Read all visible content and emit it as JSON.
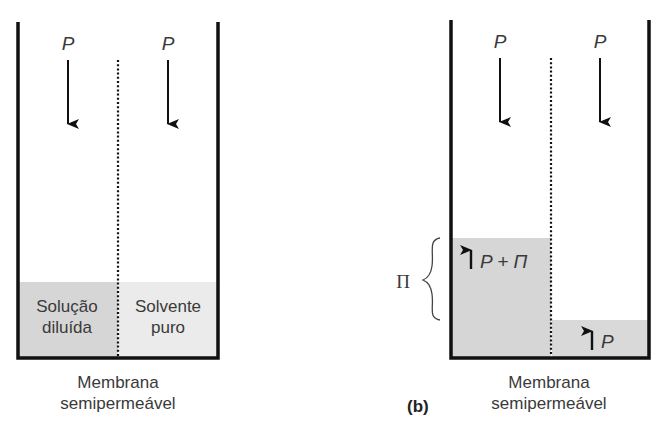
{
  "figure": {
    "panel_a": {
      "pressure_labels": [
        "P",
        "P"
      ],
      "left_compartment_label": [
        "Solução",
        "diluída"
      ],
      "right_compartment_label": [
        "Solvente",
        "puro"
      ],
      "membrane_caption": [
        "Membrana",
        "semipermeável"
      ]
    },
    "panel_b": {
      "panel_label": "(b)",
      "pressure_labels": [
        "P",
        "P"
      ],
      "left_fluid_label": "P + Π",
      "right_fluid_label": "P",
      "osmotic_pressure_label": "Π",
      "membrane_caption": [
        "Membrana",
        "semipermeável"
      ]
    },
    "colors": {
      "wall": "#111111",
      "fluid_solution": "#d6d6d6",
      "fluid_solvent": "#ebebeb",
      "fluid_right_b": "#d9d9d9",
      "text": "#3a3a3a"
    }
  }
}
